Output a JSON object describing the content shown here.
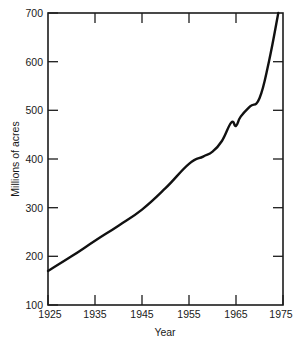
{
  "chart_data": {
    "type": "line",
    "title": "",
    "xlabel": "Year",
    "ylabel": "Millions of acres",
    "xlim": [
      1925,
      1975
    ],
    "ylim": [
      100,
      700
    ],
    "xticks": [
      1925,
      1935,
      1945,
      1955,
      1965,
      1975
    ],
    "xticklabels": [
      "1925",
      "1935",
      "1945",
      "1955",
      "1965",
      "1975"
    ],
    "yticks": [
      100,
      200,
      300,
      400,
      500,
      600,
      700
    ],
    "yticklabels": [
      "100",
      "200",
      "300",
      "400",
      "500",
      "600",
      "700"
    ],
    "grid": false,
    "legend": null,
    "series": [
      {
        "name": "Millions of acres",
        "x": [
          1925,
          1930,
          1935,
          1940,
          1945,
          1950,
          1955,
          1958,
          1960,
          1962,
          1964,
          1965,
          1966,
          1968,
          1970,
          1972,
          1974
        ],
        "values": [
          170,
          200,
          232,
          263,
          296,
          340,
          390,
          405,
          415,
          437,
          475,
          468,
          487,
          508,
          525,
          600,
          700
        ]
      }
    ],
    "annotations": [
      "near-linear rise 1925-1955",
      "slight flattening around 1958-1962",
      "local peak and dip near 1964-1965",
      "steep acceleration after 1970"
    ],
    "line_color": "#111111",
    "axis_color": "#1c1c1c",
    "background_color": "#ffffff"
  },
  "axes": {
    "y_title": "Millions of acres",
    "x_title": "Year"
  }
}
